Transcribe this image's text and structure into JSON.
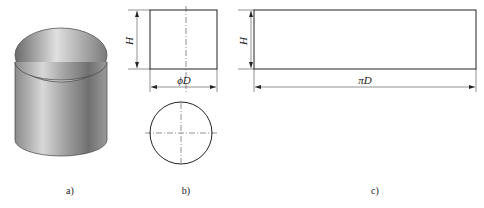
{
  "figure": {
    "panels": [
      {
        "id": "a",
        "caption": "a)",
        "content": "shaded 3D cylinder shell"
      },
      {
        "id": "b",
        "caption": "b)",
        "content": "front and top views",
        "height_label": "H",
        "width_label": "ϕD"
      },
      {
        "id": "c",
        "caption": "c)",
        "content": "unrolled rectangle development",
        "height_label": "H",
        "width_label": "πD"
      }
    ]
  },
  "colors": {
    "line": "#222222",
    "shade_dark": "#6a6a6a",
    "shade_light": "#e8e8e8"
  }
}
